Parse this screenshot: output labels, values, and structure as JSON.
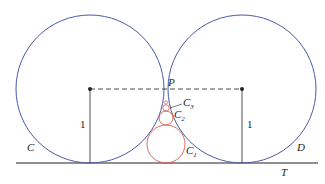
{
  "labels": {
    "circle_left": "C",
    "circle_right": "D",
    "point": "P",
    "line": "T",
    "c1": "C",
    "c2": "C",
    "c3": "C",
    "c1_sub": "1",
    "c2_sub": "2",
    "c3_sub": "3",
    "radius_left": "1",
    "radius_right": "1"
  },
  "colors": {
    "big_circles": "#4a5aa8",
    "small_circles": "#e0574a",
    "lines": "#222222"
  }
}
